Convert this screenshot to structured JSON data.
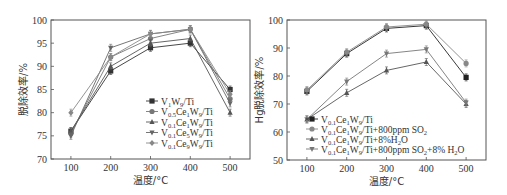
{
  "chart_data": [
    {
      "type": "line",
      "title": "",
      "xlabel": "温度/°C",
      "ylabel": "脱除效率/%",
      "x": [
        100,
        200,
        300,
        400,
        500
      ],
      "xlim": [
        50,
        550
      ],
      "ylim": [
        70,
        100
      ],
      "yticks": [
        70,
        75,
        80,
        85,
        90,
        95,
        100
      ],
      "xticks": [
        100,
        200,
        300,
        400,
        500
      ],
      "grid": false,
      "legend_position": "lower right",
      "series": [
        {
          "name": "V1W9/Ti",
          "label_parts": [
            [
              "V",
              ""
            ],
            [
              "1",
              "sub"
            ],
            [
              "W",
              ""
            ],
            [
              "9",
              "sub"
            ],
            [
              "/Ti",
              ""
            ]
          ],
          "marker": "square",
          "color": "#333333",
          "values": [
            76,
            89,
            94,
            95,
            85
          ]
        },
        {
          "name": "V0.5Ce1W9/Ti",
          "label_parts": [
            [
              "V",
              ""
            ],
            [
              "0.5",
              "sub"
            ],
            [
              "Ce",
              ""
            ],
            [
              "1",
              "sub"
            ],
            [
              "W",
              ""
            ],
            [
              "9",
              "sub"
            ],
            [
              "/Ti",
              ""
            ]
          ],
          "marker": "circle",
          "color": "#777777",
          "values": [
            75.5,
            92,
            96,
            98,
            83
          ]
        },
        {
          "name": "V0.1Ce1W9/Ti",
          "label_parts": [
            [
              "V",
              ""
            ],
            [
              "0.1",
              "sub"
            ],
            [
              "Ce",
              ""
            ],
            [
              "1",
              "sub"
            ],
            [
              "W",
              ""
            ],
            [
              "9",
              "sub"
            ],
            [
              "/Ti",
              ""
            ]
          ],
          "marker": "triangle",
          "color": "#555555",
          "values": [
            76,
            90,
            95,
            96,
            80
          ]
        },
        {
          "name": "V0.1Ce5W9/Ti",
          "label_parts": [
            [
              "V",
              ""
            ],
            [
              "0.1",
              "sub"
            ],
            [
              "Ce",
              ""
            ],
            [
              "5",
              "sub"
            ],
            [
              "W",
              ""
            ],
            [
              "9",
              "sub"
            ],
            [
              "/Ti",
              ""
            ]
          ],
          "marker": "tri-down",
          "color": "#666666",
          "values": [
            75,
            94,
            97,
            98,
            82
          ]
        },
        {
          "name": "V0.1Ce9W9/Ti",
          "label_parts": [
            [
              "V",
              ""
            ],
            [
              "0.1",
              "sub"
            ],
            [
              "Ce",
              ""
            ],
            [
              "9",
              "sub"
            ],
            [
              "W",
              ""
            ],
            [
              "9",
              "sub"
            ],
            [
              "/Ti",
              ""
            ]
          ],
          "marker": "diamond",
          "color": "#888888",
          "values": [
            80,
            92,
            97,
            98,
            84
          ]
        }
      ]
    },
    {
      "type": "line",
      "title": "",
      "xlabel": "温度/°C",
      "ylabel": "Hg脱除效率/%",
      "x": [
        100,
        200,
        300,
        400,
        500
      ],
      "xlim": [
        50,
        550
      ],
      "ylim": [
        50,
        100
      ],
      "yticks": [
        50,
        60,
        70,
        80,
        90,
        100
      ],
      "xticks": [
        100,
        200,
        300,
        400,
        500
      ],
      "grid": false,
      "legend_position": "lower left",
      "series": [
        {
          "name": "V0.1Ce1W9/Ti",
          "label_parts": [
            [
              "V",
              ""
            ],
            [
              "0.1",
              "sub"
            ],
            [
              "Ce",
              ""
            ],
            [
              "1",
              "sub"
            ],
            [
              "W",
              ""
            ],
            [
              "9",
              "sub"
            ],
            [
              "/Ti",
              ""
            ]
          ],
          "marker": "square",
          "color": "#222222",
          "values": [
            74.5,
            88,
            97,
            98,
            79.5
          ]
        },
        {
          "name": "V0.1Ce1W9/Ti+800ppm SO2",
          "label_parts": [
            [
              "V",
              ""
            ],
            [
              "0.1",
              "sub"
            ],
            [
              "Ce",
              ""
            ],
            [
              "1",
              "sub"
            ],
            [
              "W",
              ""
            ],
            [
              "9",
              "sub"
            ],
            [
              "/Ti+800ppm SO",
              ""
            ],
            [
              "2",
              "sub"
            ]
          ],
          "marker": "circle",
          "color": "#888888",
          "values": [
            75,
            88.5,
            97.5,
            98.5,
            84.5
          ]
        },
        {
          "name": "V0.1Ce1W9/Ti+8%H2O",
          "label_parts": [
            [
              "V",
              ""
            ],
            [
              "0.1",
              "sub"
            ],
            [
              "Ce",
              ""
            ],
            [
              "1",
              "sub"
            ],
            [
              "W",
              ""
            ],
            [
              "9",
              "sub"
            ],
            [
              "/Ti+8%H",
              ""
            ],
            [
              "2",
              "sub"
            ],
            [
              "O",
              ""
            ]
          ],
          "marker": "triangle",
          "color": "#555555",
          "values": [
            64.5,
            74,
            82,
            85,
            70
          ]
        },
        {
          "name": "V0.1Ce1W9/Ti+800ppm SO2+8% H2O",
          "label_parts": [
            [
              "V",
              ""
            ],
            [
              "0.1",
              "sub"
            ],
            [
              "Ce",
              ""
            ],
            [
              "1",
              "sub"
            ],
            [
              "W",
              ""
            ],
            [
              "9",
              "sub"
            ],
            [
              "/Ti+800ppm SO",
              ""
            ],
            [
              "2",
              "sub"
            ],
            [
              "+8% H",
              ""
            ],
            [
              "2",
              "sub"
            ],
            [
              "O",
              ""
            ]
          ],
          "marker": "tri-down",
          "color": "#777777",
          "values": [
            64.5,
            78,
            88,
            89.5,
            70.5
          ]
        }
      ]
    }
  ],
  "layout": {
    "charts": [
      {
        "plot": {
          "x0": 51,
          "y0": 20,
          "x1": 250,
          "y1": 159
        },
        "legend": {
          "x": 146,
          "y": 101,
          "dy": 10.5
        }
      },
      {
        "plot": {
          "x0": 287,
          "y0": 20,
          "x1": 486,
          "y1": 160
        },
        "legend": {
          "x": 306,
          "y": 119,
          "dy": 10
        }
      }
    ]
  }
}
